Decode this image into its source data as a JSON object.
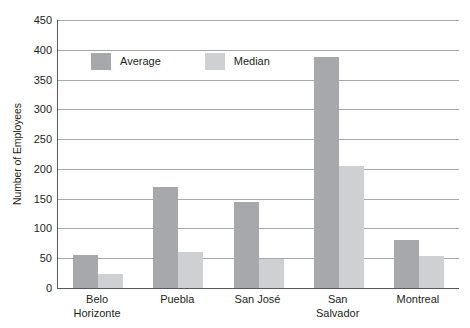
{
  "chart_data": {
    "type": "bar",
    "title": "",
    "xlabel": "",
    "ylabel": "Number of Employees",
    "ylim": [
      0,
      450
    ],
    "ytick_step": 50,
    "yticks": [
      450,
      400,
      350,
      300,
      250,
      200,
      150,
      100,
      50,
      0
    ],
    "grid": true,
    "legend_position": "inside-top-left",
    "categories": [
      "Belo Horizonte",
      "Puebla",
      "San José",
      "San Salvador",
      "Montreal"
    ],
    "category_lines": [
      [
        "Belo",
        "Horizonte"
      ],
      [
        "Puebla"
      ],
      [
        "San José"
      ],
      [
        "San",
        "Salvador"
      ],
      [
        "Montreal"
      ]
    ],
    "series": [
      {
        "name": "Average",
        "color": "#a6a8ab",
        "values": [
          55,
          170,
          145,
          388,
          80
        ]
      },
      {
        "name": "Median",
        "color": "#cfd0d2",
        "values": [
          23,
          60,
          48,
          205,
          53
        ]
      }
    ]
  },
  "legend": {
    "items": [
      {
        "label": "Average",
        "color": "#a6a8ab"
      },
      {
        "label": "Median",
        "color": "#cfd0d2"
      }
    ]
  },
  "axes": {
    "line_color": "#58595b",
    "grid_color": "#a7a9ac"
  }
}
